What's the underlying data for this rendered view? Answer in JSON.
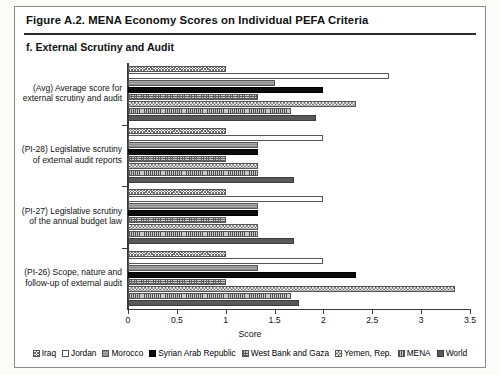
{
  "figure": {
    "title": "Figure A.2. MENA Economy Scores on Individual PEFA Criteria",
    "subtitle": "f. External Scrutiny and Audit"
  },
  "chart_data": {
    "type": "bar",
    "orientation": "horizontal",
    "title": "f. External Scrutiny and Audit",
    "xlabel": "Score",
    "ylabel": "",
    "xlim": [
      0,
      3.5
    ],
    "xticks": [
      0,
      0.5,
      1,
      1.5,
      2,
      2.5,
      3,
      3.5
    ],
    "xticklabels": [
      "0",
      "0.5",
      "1",
      "1.5",
      "2",
      "2.5",
      "3",
      "3.5"
    ],
    "grid": false,
    "legend_position": "bottom",
    "categories": [
      "(Avg) Average score for external scrutiny and audit",
      "(PI-28) Legislative scrutiny of external audit reports",
      "(PI-27) Legislative scrutiny of the annual budget law",
      "(PI-26) Scope, nature and follow-up of external audit"
    ],
    "category_lines": [
      [
        "(Avg) Average score for",
        "external scrutiny and audit"
      ],
      [
        "(PI-28) Legislative scrutiny",
        "of external audit reports"
      ],
      [
        "(PI-27) Legislative scrutiny",
        "of the annual budget law"
      ],
      [
        "(PI-26) Scope, nature and",
        "follow-up of external audit"
      ]
    ],
    "series": [
      {
        "name": "Iraq",
        "pattern": "dense-cross-hatch",
        "values": [
          1.0,
          1.0,
          1.0,
          1.0
        ]
      },
      {
        "name": "Jordan",
        "pattern": "open-white",
        "values": [
          2.67,
          2.0,
          2.0,
          2.0
        ]
      },
      {
        "name": "Morocco",
        "pattern": "grey-horizontal",
        "values": [
          1.5,
          1.33,
          1.33,
          1.33
        ]
      },
      {
        "name": "Syrian Arab Republic",
        "pattern": "solid-black",
        "values": [
          2.0,
          1.33,
          1.33,
          2.33
        ]
      },
      {
        "name": "West Bank and Gaza",
        "pattern": "speckled-grey",
        "values": [
          1.33,
          1.0,
          1.0,
          1.0
        ]
      },
      {
        "name": "Yemen, Rep.",
        "pattern": "checkerboard",
        "values": [
          2.33,
          1.33,
          1.33,
          3.35
        ]
      },
      {
        "name": "MENA",
        "pattern": "vertical-pinstripe",
        "values": [
          1.67,
          1.33,
          1.33,
          1.67
        ]
      },
      {
        "name": "World",
        "pattern": "dark-grey-solid",
        "values": [
          1.92,
          1.7,
          1.7,
          1.75
        ]
      }
    ]
  }
}
